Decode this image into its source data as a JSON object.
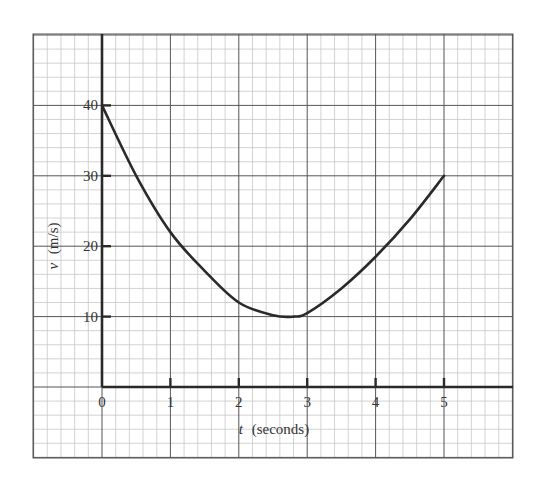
{
  "chart_data": {
    "type": "line",
    "title": "",
    "xlabel": "t (seconds)",
    "xlabel_var": "t",
    "xlabel_unit": "(seconds)",
    "ylabel": "v (m/s)",
    "ylabel_var": "v",
    "ylabel_unit": "(m/s)",
    "xlim": [
      -1,
      6
    ],
    "ylim": [
      -10,
      50
    ],
    "x_ticks": [
      0,
      1,
      2,
      3,
      4,
      5
    ],
    "x_tick_labels": [
      "0",
      "1",
      "2",
      "3",
      "4",
      "5"
    ],
    "y_ticks": [
      10,
      20,
      30,
      40
    ],
    "y_tick_labels": [
      "10",
      "20",
      "30",
      "40"
    ],
    "grid": true,
    "grid_minor_x": 0.2,
    "grid_minor_y": 2,
    "legend": null,
    "series": [
      {
        "name": "v(t)",
        "x": [
          0,
          0.5,
          1,
          1.5,
          2,
          2.5,
          2.8,
          3,
          3.5,
          4,
          4.5,
          5
        ],
        "values": [
          40,
          30,
          22,
          16.5,
          12,
          10.2,
          10,
          10.5,
          14,
          18.5,
          23.8,
          30
        ]
      }
    ]
  },
  "colors": {
    "background": "#ffffff",
    "grid_minor": "#c8c8c8",
    "grid_major": "#555555",
    "axis": "#2a2a2a",
    "curve": "#2a2a2a",
    "text": "#333333"
  }
}
